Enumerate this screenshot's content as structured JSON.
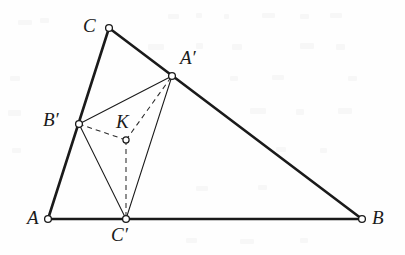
{
  "figure": {
    "kind": "euclidean-geometry-diagram",
    "caption_text": "",
    "background_color": "#fefefe",
    "ink_color": "#1a1a1a",
    "outer_triangle": {
      "name": "ABC",
      "stroke_width": 2.6,
      "style": "solid",
      "vertices": [
        {
          "id": "A",
          "label": "A",
          "x": 48,
          "y": 219,
          "label_x": 27,
          "label_y": 208,
          "marker": "open-circle"
        },
        {
          "id": "B",
          "label": "B",
          "x": 362,
          "y": 219,
          "label_x": 372,
          "label_y": 208,
          "marker": "open-circle"
        },
        {
          "id": "C",
          "label": "C",
          "x": 109,
          "y": 28,
          "label_x": 83,
          "label_y": 16,
          "marker": "open-circle"
        }
      ],
      "edges": [
        {
          "id": "AB",
          "from": "A",
          "to": "B"
        },
        {
          "id": "BC",
          "from": "B",
          "to": "C"
        },
        {
          "id": "CA",
          "from": "C",
          "to": "A"
        }
      ]
    },
    "inner_triangle": {
      "name": "A'B'C'",
      "stroke_width": 1.0,
      "style": "solid",
      "vertices": [
        {
          "id": "Ap",
          "label": "A",
          "prime": "′",
          "x": 172,
          "y": 76,
          "label_x": 180,
          "label_y": 48,
          "marker": "open-circle",
          "lies_on": "BC"
        },
        {
          "id": "Bp",
          "label": "B",
          "prime": "′",
          "x": 79,
          "y": 124,
          "label_x": 43,
          "label_y": 110,
          "marker": "open-circle",
          "lies_on": "CA"
        },
        {
          "id": "Cp",
          "label": "C",
          "prime": "′",
          "x": 126,
          "y": 219,
          "label_x": 111,
          "label_y": 225,
          "marker": "open-circle",
          "lies_on": "AB"
        }
      ],
      "edges": [
        {
          "id": "ApBp",
          "from": "Ap",
          "to": "Bp"
        },
        {
          "id": "BpCp",
          "from": "Bp",
          "to": "Cp"
        },
        {
          "id": "CpAp",
          "from": "Cp",
          "to": "Ap"
        }
      ]
    },
    "interior_point": {
      "id": "K",
      "label": "K",
      "x": 126,
      "y": 140,
      "label_x": 116,
      "label_y": 112,
      "marker": "open-circle"
    },
    "cevians": {
      "style": "dashed",
      "stroke_width": 1.0,
      "dash_pattern": "5,4",
      "segments": [
        {
          "id": "K-Ap",
          "from": "K",
          "to": "Ap"
        },
        {
          "id": "K-Bp",
          "from": "K",
          "to": "Bp"
        },
        {
          "id": "K-Cp",
          "from": "K",
          "to": "Cp"
        }
      ]
    },
    "markers": {
      "radius": 3.4,
      "fill": "#ffffff",
      "stroke": "#1a1a1a",
      "stroke_width": 1.3
    }
  }
}
